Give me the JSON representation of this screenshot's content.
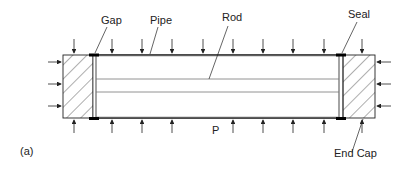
{
  "figure": {
    "panel_label": "(a)",
    "labels": {
      "gap": "Gap",
      "pipe": "Pipe",
      "rod": "Rod",
      "seal": "Seal",
      "pressure": "P",
      "end_cap": "End Cap"
    },
    "colors": {
      "line": "#1a1a1a",
      "seal": "#000000",
      "background": "#ffffff"
    }
  }
}
